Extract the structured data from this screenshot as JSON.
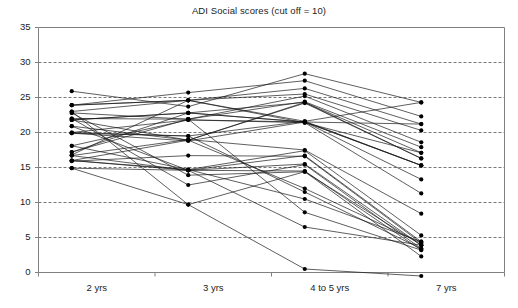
{
  "chart": {
    "title": "ADI Social scores (cut off = 10)",
    "yticks": [
      "0",
      "5",
      "10",
      "15",
      "20",
      "25",
      "30",
      "35"
    ],
    "xticks": [
      "2 yrs",
      "3 yrs",
      "4 to 5 yrs",
      "7 yrs"
    ],
    "colors": {
      "line": "#1a1a1a",
      "marker": "#000000",
      "grid": "#555555",
      "axis": "#808080",
      "text": "#1c1c1c",
      "background": "#ffffff"
    }
  },
  "chart_data": {
    "type": "line",
    "title": "ADI Social scores (cut off = 10)",
    "subtitle": "",
    "xlabel": "",
    "ylabel": "",
    "categories": [
      "2 yrs",
      "3 yrs",
      "4 to 5 yrs",
      "7 yrs"
    ],
    "x": [
      0,
      1,
      2,
      3
    ],
    "ylim": [
      0,
      35
    ],
    "ytick_values": [
      0,
      5,
      10,
      15,
      20,
      25,
      30,
      35
    ],
    "grid": true,
    "grid_axis": "y",
    "legend": "none",
    "marker": "filled-circle",
    "annotations": [
      "cut off = 10"
    ],
    "series": [
      {
        "name": "subject-1",
        "values": [
          25.9,
          23.7,
          28.4,
          24.3
        ]
      },
      {
        "name": "subject-2",
        "values": [
          23.9,
          25.7,
          27.4,
          22.3
        ]
      },
      {
        "name": "subject-3",
        "values": [
          23.9,
          24.6,
          26.3,
          21.2
        ]
      },
      {
        "name": "subject-4",
        "values": [
          23.0,
          24.6,
          25.5,
          20.3
        ]
      },
      {
        "name": "subject-5",
        "values": [
          22.8,
          21.9,
          25.2,
          18.6
        ]
      },
      {
        "name": "subject-6",
        "values": [
          22.0,
          21.9,
          24.4,
          17.9
        ]
      },
      {
        "name": "subject-7",
        "values": [
          21.8,
          22.8,
          24.3,
          17.1
        ]
      },
      {
        "name": "subject-8",
        "values": [
          20.9,
          18.9,
          24.2,
          16.3
        ]
      },
      {
        "name": "subject-9",
        "values": [
          20.0,
          19.5,
          21.6,
          15.3
        ]
      },
      {
        "name": "subject-10",
        "values": [
          19.9,
          18.8,
          21.5,
          15.3
        ]
      },
      {
        "name": "subject-11",
        "values": [
          18.1,
          21.8,
          21.5,
          21.2
        ]
      },
      {
        "name": "subject-12",
        "values": [
          17.2,
          22.8,
          21.5,
          13.3
        ]
      },
      {
        "name": "subject-13",
        "values": [
          16.8,
          24.6,
          21.4,
          11.3
        ]
      },
      {
        "name": "subject-14",
        "values": [
          16.7,
          19.0,
          17.5,
          8.4
        ]
      },
      {
        "name": "subject-15",
        "values": [
          16.0,
          14.7,
          17.4,
          5.3
        ]
      },
      {
        "name": "subject-16",
        "values": [
          16.0,
          14.6,
          16.7,
          4.4
        ]
      },
      {
        "name": "subject-17",
        "values": [
          15.9,
          16.7,
          16.6,
          4.2
        ]
      },
      {
        "name": "subject-18",
        "values": [
          14.9,
          14.6,
          15.5,
          3.9
        ]
      },
      {
        "name": "subject-19",
        "values": [
          22.0,
          12.5,
          15.4,
          3.4
        ]
      },
      {
        "name": "subject-20",
        "values": [
          20.9,
          14.6,
          14.5,
          3.2
        ]
      },
      {
        "name": "subject-21",
        "values": [
          22.8,
          13.9,
          14.4,
          2.3
        ]
      },
      {
        "name": "subject-22",
        "values": [
          23.0,
          9.7,
          14.4,
          3.9
        ]
      },
      {
        "name": "subject-23",
        "values": [
          21.8,
          18.9,
          12.0,
          4.2
        ]
      },
      {
        "name": "subject-24",
        "values": [
          19.9,
          19.5,
          11.5,
          3.4
        ]
      },
      {
        "name": "subject-25",
        "values": [
          18.1,
          14.7,
          10.5,
          4.4
        ]
      },
      {
        "name": "subject-26",
        "values": [
          17.2,
          21.9,
          8.6,
          3.2
        ]
      },
      {
        "name": "subject-27",
        "values": [
          16.7,
          14.6,
          6.5,
          3.9
        ]
      },
      {
        "name": "subject-28",
        "values": [
          14.9,
          9.7,
          0.5,
          -0.5
        ]
      },
      {
        "name": "subject-29",
        "values": [
          23.9,
          24.6,
          21.6,
          24.3
        ]
      },
      {
        "name": "subject-30",
        "values": [
          21.8,
          22.8,
          21.5,
          15.3
        ]
      },
      {
        "name": "subject-31",
        "values": [
          16.0,
          18.9,
          24.3,
          16.3
        ]
      },
      {
        "name": "subject-32",
        "values": [
          20.0,
          21.8,
          21.4,
          17.1
        ]
      }
    ]
  }
}
